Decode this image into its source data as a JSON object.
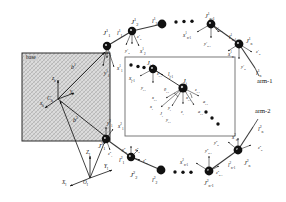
{
  "figure": {
    "type": "kinematic-diagram",
    "background": "#ffffff",
    "ink": "#101010",
    "base_fill": "#d9d9d9",
    "inset_border": "#6a6a6a"
  },
  "base": {
    "tag": "base",
    "centroid": "C",
    "centroid_sub": "b",
    "axes": [
      {
        "name": "x-base",
        "label": "x",
        "sub": "b"
      },
      {
        "name": "y-base",
        "label": "y",
        "sub": "b"
      },
      {
        "name": "z-base",
        "label": "z",
        "sub": "b"
      }
    ],
    "vectors": [
      {
        "name": "base-to-arm1-root",
        "label": "b",
        "sup": "1"
      },
      {
        "name": "base-to-arm2-root",
        "label": "b",
        "sup": "2"
      }
    ]
  },
  "inertial_frame": {
    "origin": "O",
    "origin_sub": "I",
    "x": "X",
    "x_sub": "I",
    "y": "Y",
    "y_sub": "I",
    "z": "Z",
    "z_sub": "I"
  },
  "arms": [
    {
      "id": "arm-1",
      "tag": "arm-1",
      "superscript": "1",
      "joints": [
        "J₁",
        "J₂",
        "J_{n-1}",
        "J_n"
      ],
      "links": [
        "l₁",
        "l₂",
        "l_{n-1}",
        "l_n"
      ],
      "end_vector": "l"
    },
    {
      "id": "arm-2",
      "tag": "arm-2",
      "superscript": "2",
      "joints": [
        "J₁",
        "J₂",
        "J_{n-1}",
        "J_n"
      ],
      "links": [
        "l₁",
        "l₂",
        "l_{n-1}",
        "l_n"
      ],
      "end_vector": "l"
    }
  ],
  "labels": {
    "arm1": [
      {
        "name": "joint-J1-arm1",
        "base": "J",
        "sub": "1",
        "sup": "1",
        "x": 103,
        "y": 30,
        "size": "sz7"
      },
      {
        "name": "axis-z1-arm1",
        "base": "z",
        "sub": "1",
        "sup": "1",
        "x": 107,
        "y": 51,
        "size": "sz45"
      },
      {
        "name": "axis-y1-arm1",
        "base": "y",
        "sub": "1",
        "sup": "1",
        "x": 104,
        "y": 71,
        "size": "sz5"
      },
      {
        "name": "axis-x1-arm1",
        "base": "x",
        "sub": "1",
        "sup": "1",
        "x": 117,
        "y": 66,
        "size": "sz5"
      },
      {
        "name": "link-l1-arm1",
        "base": "l",
        "sub": "1",
        "sup": "1",
        "x": 117,
        "y": 30,
        "size": "sz6"
      },
      {
        "name": "joint-J2-arm1",
        "base": "J",
        "sub": "2",
        "sup": "1",
        "x": 131,
        "y": 19,
        "size": "sz7"
      },
      {
        "name": "axis-z2-arm1",
        "base": "z",
        "sub": "2",
        "sup": "1",
        "x": 137,
        "y": 35,
        "size": "sz45"
      },
      {
        "name": "axis-y2-arm1",
        "base": "y",
        "sub": "2",
        "sup": "1",
        "x": 125,
        "y": 49,
        "size": "sz45"
      },
      {
        "name": "axis-x2-arm1",
        "base": "x",
        "sub": "2",
        "sup": "1",
        "x": 140,
        "y": 49,
        "size": "sz5"
      },
      {
        "name": "link-l2-arm1",
        "base": "l",
        "sub": "2",
        "sup": "1",
        "x": 152,
        "y": 18,
        "size": "sz6"
      },
      {
        "name": "joint-Jn1-arm1",
        "base": "J",
        "sub": "n-1",
        "sup": "1",
        "x": 205,
        "y": 13,
        "size": "sz6"
      },
      {
        "name": "axis-xn1-arm1",
        "base": "x",
        "sub": "n-1",
        "sup": "1",
        "x": 183,
        "y": 33,
        "size": "sz5"
      },
      {
        "name": "axis-yn1-arm1",
        "base": "y",
        "sub": "n-1",
        "sup": "1",
        "x": 204,
        "y": 42,
        "size": "sz45"
      },
      {
        "name": "axis-zn1-arm1",
        "base": "z",
        "sub": "n-1",
        "sup": "1",
        "x": 216,
        "y": 27,
        "size": "sz45"
      },
      {
        "name": "link-ln1-arm1",
        "base": "l",
        "sub": "n-1",
        "sup": "1",
        "x": 229,
        "y": 35,
        "size": "sz5"
      },
      {
        "name": "joint-Jn-arm1",
        "base": "J",
        "sub": "n",
        "sup": "1",
        "x": 246,
        "y": 38,
        "size": "sz6"
      },
      {
        "name": "axis-xn-arm1",
        "base": "x",
        "sub": "n",
        "sup": "1",
        "x": 228,
        "y": 52,
        "size": "sz5"
      },
      {
        "name": "axis-zn-arm1",
        "base": "z",
        "sub": "n",
        "sup": "1",
        "x": 256,
        "y": 50,
        "size": "sz45"
      },
      {
        "name": "axis-yn-arm1",
        "base": "y",
        "sub": "n",
        "sup": "1",
        "x": 241,
        "y": 65,
        "size": "sz45"
      },
      {
        "name": "link-ln-arm1",
        "base": "l",
        "sub": "n",
        "sup": "1",
        "x": 256,
        "y": 70,
        "size": "sz6"
      }
    ],
    "arm2": [
      {
        "name": "joint-J1-arm2",
        "base": "J",
        "sub": "1",
        "sup": "2",
        "x": 98,
        "y": 143,
        "size": "sz7"
      },
      {
        "name": "axis-y1-arm2",
        "base": "y",
        "sub": "1",
        "sup": "2",
        "x": 107,
        "y": 121,
        "size": "sz5"
      },
      {
        "name": "axis-x1-arm2",
        "base": "x",
        "sub": "1",
        "sup": "2",
        "x": 118,
        "y": 124,
        "size": "sz5"
      },
      {
        "name": "axis-z1-arm2",
        "base": "z",
        "sub": "1",
        "sup": "2",
        "x": 108,
        "y": 152,
        "size": "sz45"
      },
      {
        "name": "link-l1-arm2",
        "base": "l",
        "sub": "1",
        "sup": "2",
        "x": 119,
        "y": 157,
        "size": "sz6"
      },
      {
        "name": "joint-J2-arm2",
        "base": "J",
        "sub": "2",
        "sup": "2",
        "x": 130,
        "y": 172,
        "size": "sz7"
      },
      {
        "name": "axis-y2-arm2",
        "base": "y",
        "sub": "2",
        "sup": "2",
        "x": 122,
        "y": 148,
        "size": "sz45"
      },
      {
        "name": "axis-x2-arm2",
        "base": "x",
        "sub": "2",
        "sup": "2",
        "x": 135,
        "y": 148,
        "size": "sz45"
      },
      {
        "name": "axis-z2-arm2",
        "base": "z",
        "sub": "2",
        "sup": "2",
        "x": 143,
        "y": 159,
        "size": "sz45"
      },
      {
        "name": "link-l2-arm2",
        "base": "l",
        "sub": "2",
        "sup": "2",
        "x": 152,
        "y": 177,
        "size": "sz6"
      },
      {
        "name": "joint-Jn1-arm2",
        "base": "J",
        "sub": "n-1",
        "sup": "2",
        "x": 204,
        "y": 180,
        "size": "sz6"
      },
      {
        "name": "axis-xm1-arm2",
        "base": "x",
        "sub": "n-1",
        "sup": "2",
        "x": 180,
        "y": 160,
        "size": "sz5"
      },
      {
        "name": "axis-yn1-arm2",
        "base": "y",
        "sub": "n-1",
        "sup": "2",
        "x": 205,
        "y": 149,
        "size": "sz45"
      },
      {
        "name": "axis-zn1-arm2",
        "base": "z",
        "sub": "n-1",
        "sup": "2",
        "x": 216,
        "y": 171,
        "size": "sz45"
      },
      {
        "name": "link-ln1-arm2",
        "base": "l",
        "sub": "n-1",
        "sup": "2",
        "x": 228,
        "y": 163,
        "size": "sz5"
      },
      {
        "name": "joint-Jn-arm2",
        "base": "J",
        "sub": "n",
        "sup": "2",
        "x": 244,
        "y": 160,
        "size": "sz6"
      },
      {
        "name": "axis-xn-arm2",
        "base": "x",
        "sub": "n",
        "sup": "2",
        "x": 232,
        "y": 135,
        "size": "sz5"
      },
      {
        "name": "axis-yn-arm2",
        "base": "y",
        "sub": "n",
        "sup": "2",
        "x": 214,
        "y": 141,
        "size": "sz45"
      },
      {
        "name": "axis-zn-arm2",
        "base": "z",
        "sub": "n",
        "sup": "2",
        "x": 258,
        "y": 146,
        "size": "sz45"
      },
      {
        "name": "link-ln-arm2",
        "base": "l",
        "sub": "n",
        "sup": "2",
        "x": 258,
        "y": 126,
        "size": "sz6"
      }
    ],
    "base_group": [
      {
        "name": "base-centroid",
        "base": "C",
        "sub": "b",
        "sup": "",
        "x": 47,
        "y": 95,
        "size": "sz6"
      },
      {
        "name": "axis-xb",
        "base": "x",
        "sub": "b",
        "sup": "",
        "x": 40,
        "y": 101,
        "size": "sz5"
      },
      {
        "name": "axis-yb",
        "base": "y",
        "sub": "b",
        "sup": "",
        "x": 70,
        "y": 89,
        "size": "sz5"
      },
      {
        "name": "axis-zb",
        "base": "z",
        "sub": "b",
        "sup": "",
        "x": 52,
        "y": 76,
        "size": "sz5"
      },
      {
        "name": "vector-b1",
        "base": "b",
        "sub": "",
        "sup": "1",
        "x": 71,
        "y": 64,
        "size": "sz6"
      },
      {
        "name": "vector-b2",
        "base": "b",
        "sub": "",
        "sup": "2",
        "x": 73,
        "y": 117,
        "size": "sz6"
      }
    ],
    "inertial_group": [
      {
        "name": "axis-ZI",
        "base": "Z",
        "sub": "I",
        "sup": "",
        "x": 86,
        "y": 150,
        "size": "sz5"
      },
      {
        "name": "axis-YI",
        "base": "Y",
        "sub": "I",
        "sup": "",
        "x": 104,
        "y": 164,
        "size": "sz5"
      },
      {
        "name": "axis-XI",
        "base": "X",
        "sub": "I",
        "sup": "",
        "x": 62,
        "y": 180,
        "size": "sz5"
      },
      {
        "name": "origin-OI",
        "base": "O",
        "sub": "I",
        "sup": "",
        "x": 83,
        "y": 180,
        "size": "sz5"
      }
    ],
    "inset": [
      {
        "name": "inset-joint-Jj1",
        "base": "J",
        "sub": "j-1",
        "sup": "",
        "x": 147,
        "y": 60,
        "size": "sz6"
      },
      {
        "name": "inset-axis-xj1",
        "base": "x",
        "sub": "j-1",
        "sup": "",
        "x": 129,
        "y": 76,
        "size": "sz5"
      },
      {
        "name": "inset-axis-zj1",
        "base": "z",
        "sub": "j-1",
        "sup": "",
        "x": 157,
        "y": 72,
        "size": "sz45"
      },
      {
        "name": "inset-axis-yj1",
        "base": "y",
        "sub": "j-1",
        "sup": "",
        "x": 141,
        "y": 86,
        "size": "sz45"
      },
      {
        "name": "inset-link-lj1",
        "base": "l",
        "sub": "j-1",
        "sup": "",
        "x": 168,
        "y": 72,
        "size": "sz5"
      },
      {
        "name": "inset-joint-Jj",
        "base": "J",
        "sub": "j",
        "sup": "",
        "x": 183,
        "y": 78,
        "size": "sz6"
      },
      {
        "name": "inset-theta-j1",
        "base": "θ",
        "sub": "j-1",
        "sup": "",
        "x": 164,
        "y": 88,
        "size": "sz45"
      },
      {
        "name": "inset-theta-j",
        "base": "θ",
        "sub": "j",
        "sup": "",
        "x": 184,
        "y": 88,
        "size": "sz45"
      },
      {
        "name": "inset-axis-zj",
        "base": "z",
        "sub": "j-1",
        "sup": "",
        "x": 195,
        "y": 88,
        "size": "sz45"
      },
      {
        "name": "inset-axis-xj",
        "base": "x",
        "sub": "j-1",
        "sup": "",
        "x": 152,
        "y": 96,
        "size": "sz45"
      },
      {
        "name": "inset-axis-xj2",
        "base": "x",
        "sub": "j-1",
        "sup": "",
        "x": 186,
        "y": 96,
        "size": "sz45"
      },
      {
        "name": "inset-alpha-j1",
        "base": "a",
        "sub": "j-1",
        "sup": "",
        "x": 203,
        "y": 100,
        "size": "sz45"
      },
      {
        "name": "inset-axis-xjb",
        "base": "x",
        "sub": "j",
        "sup": "",
        "x": 150,
        "y": 105,
        "size": "sz45"
      },
      {
        "name": "inset-axis-yj",
        "base": "y",
        "sub": "j",
        "sup": "",
        "x": 168,
        "y": 106,
        "size": "sz45"
      },
      {
        "name": "inset-alpha-j2",
        "base": "a",
        "sub": "j-1",
        "sup": "",
        "x": 198,
        "y": 110,
        "size": "sz45"
      },
      {
        "name": "inset-axis-zjb",
        "base": "z",
        "sub": "j",
        "sup": "",
        "x": 181,
        "y": 110,
        "size": "sz45"
      },
      {
        "name": "inset-axis-yj1b",
        "base": "y",
        "sub": "j-1",
        "sup": "",
        "x": 166,
        "y": 118,
        "size": "sz45"
      },
      {
        "name": "inset-axis-Jj2",
        "base": "J",
        "sub": "j",
        "sup": "",
        "x": 160,
        "y": 112,
        "size": "sz45"
      }
    ]
  },
  "annotations": {
    "arm1_tag": "arm-1",
    "arm2_tag": "arm-2",
    "base_tag": "base"
  }
}
